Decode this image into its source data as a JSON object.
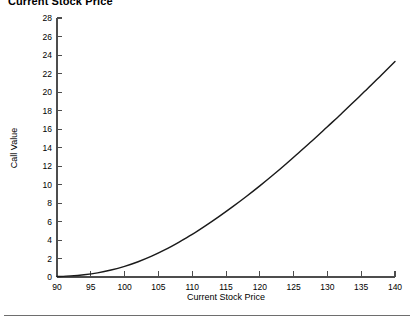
{
  "figure": {
    "title": "Current Stock Price",
    "background_color": "#ffffff",
    "axis_color": "#4d4d4d",
    "curve_color": "#1a1a1a",
    "footer_rule": true
  },
  "chart_data": {
    "type": "line",
    "title": "Current Stock Price",
    "xlabel": "Current Stock Price",
    "ylabel": "Call Value",
    "xlim": [
      90,
      140
    ],
    "ylim": [
      0,
      28
    ],
    "grid": false,
    "legend": false,
    "xticks": [
      90,
      95,
      100,
      105,
      110,
      115,
      120,
      125,
      130,
      135,
      140
    ],
    "yticks": [
      0,
      2,
      4,
      6,
      8,
      10,
      12,
      14,
      16,
      18,
      20,
      22,
      24,
      26,
      28
    ],
    "xtick_labels": [
      "90",
      "95",
      "100",
      "105",
      "110",
      "115",
      "120",
      "125",
      "130",
      "135",
      "140"
    ],
    "ytick_labels": [
      "0",
      "2",
      "4",
      "6",
      "8",
      "10",
      "12",
      "14",
      "16",
      "18",
      "20",
      "22",
      "24",
      "26",
      "28"
    ],
    "series": [
      {
        "name": "Call Value",
        "x": [
          90,
          92,
          94,
          96,
          98,
          100,
          102,
          104,
          106,
          108,
          110,
          112,
          114,
          116,
          118,
          120,
          122,
          124,
          126,
          128,
          130,
          132,
          134,
          136,
          138,
          140
        ],
        "values": [
          0.05,
          0.12,
          0.25,
          0.45,
          0.75,
          1.15,
          1.65,
          2.25,
          2.95,
          3.75,
          4.6,
          5.55,
          6.55,
          7.6,
          8.7,
          9.85,
          11.05,
          12.3,
          13.6,
          14.9,
          16.25,
          17.6,
          19.0,
          20.4,
          21.85,
          23.3
        ]
      }
    ]
  }
}
